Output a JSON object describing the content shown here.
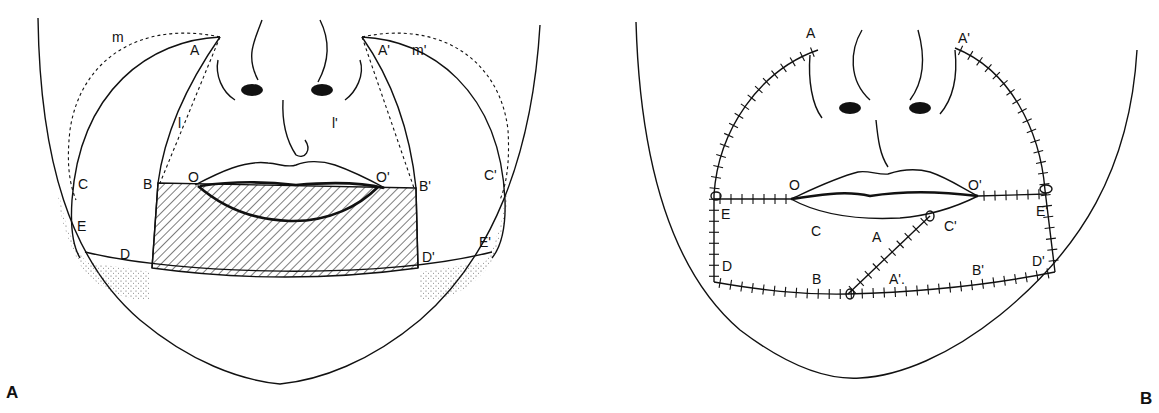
{
  "panels": [
    {
      "id": "A",
      "panel_label": "A",
      "description": "Preoperative design: hatched lower-lip defect with bilateral flaps",
      "labels": {
        "A": "A",
        "A_prime": "A'",
        "m": "m",
        "m_prime": "m'",
        "l": "l",
        "l_prime": "l'",
        "O": "O",
        "O_prime": "O'",
        "B": "B",
        "B_prime": "B'",
        "C": "C",
        "C_prime": "C'",
        "E": "E",
        "E_prime": "E'",
        "D": "D",
        "D_prime": "D'"
      }
    },
    {
      "id": "B",
      "panel_label": "B",
      "description": "Postoperative result: flaps rotated and sutured",
      "labels": {
        "A": "A",
        "A_prime": "A'",
        "O": "O",
        "O_prime": "O'",
        "E": "E",
        "E_prime": "E'",
        "C": "C",
        "A_mid": "A",
        "C_prime": "C'",
        "D": "D",
        "D_prime": "D'",
        "B": "B",
        "A_prime_low": "A'.",
        "B_prime": "B'"
      }
    }
  ],
  "colors": {
    "ink": "#111111",
    "background": "#ffffff"
  }
}
